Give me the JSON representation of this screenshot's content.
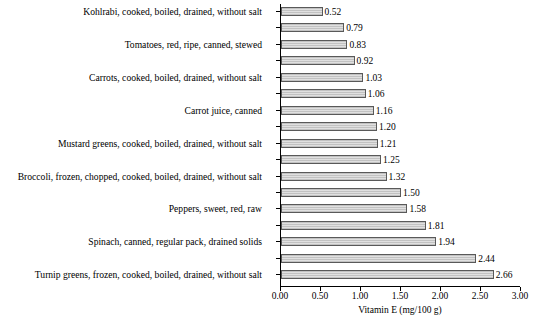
{
  "chart_data": {
    "type": "bar",
    "orientation": "horizontal",
    "title": "",
    "subtitle": "",
    "xlabel": "Vitamin E (mg/100 g)",
    "ylabel": "",
    "xlim": [
      0.0,
      3.0
    ],
    "xticks": [
      "0.00",
      "0.50",
      "1.00",
      "1.50",
      "2.00",
      "2.50",
      "3.00"
    ],
    "xtick_values": [
      0.0,
      0.5,
      1.0,
      1.5,
      2.0,
      2.5,
      3.0
    ],
    "grid": false,
    "legend": null,
    "bar_fill": "#cfcfcf",
    "bar_edge": "#595959",
    "categories": [
      "Kohlrabi, cooked, boiled, drained, without salt",
      "",
      "Tomatoes, red, ripe, canned, stewed",
      "",
      "Carrots, cooked, boiled, drained, without salt",
      "",
      "Carrot juice, canned",
      "",
      "Mustard greens, cooked, boiled, drained, without salt",
      "",
      "Broccoli, frozen, chopped, cooked, boiled, drained, without salt",
      "",
      "Peppers, sweet, red, raw",
      "",
      "Spinach, canned, regular pack, drained solids",
      "",
      "Turnip greens, frozen, cooked, boiled, drained, without salt"
    ],
    "values": [
      0.52,
      0.79,
      0.83,
      0.92,
      1.03,
      1.06,
      1.16,
      1.2,
      1.21,
      1.25,
      1.32,
      1.5,
      1.58,
      1.81,
      1.94,
      2.44,
      2.66
    ],
    "value_labels": [
      "0.52",
      "0.79",
      "0.83",
      "0.92",
      "1.03",
      "1.06",
      "1.16",
      "1.20",
      "1.21",
      "1.25",
      "1.32",
      "1.50",
      "1.58",
      "1.81",
      "1.94",
      "2.44",
      "2.66"
    ]
  }
}
